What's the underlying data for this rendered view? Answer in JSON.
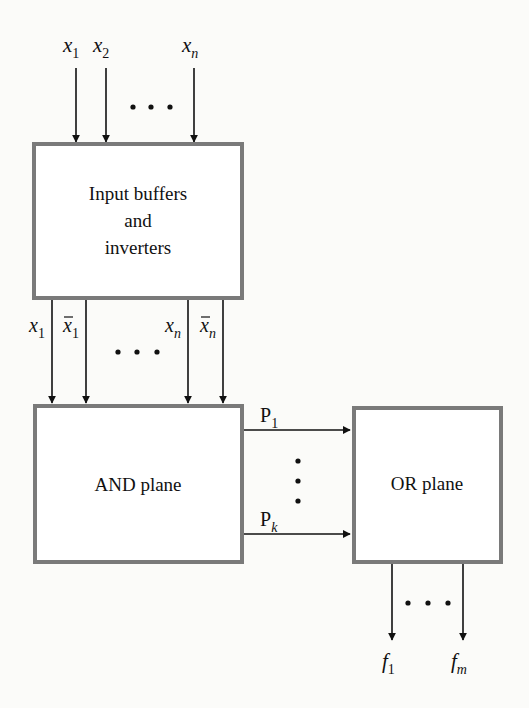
{
  "diagram": {
    "colors": {
      "background": "#fbfbf9",
      "box_border": "#7a7a7a",
      "line": "#111111"
    },
    "inputs": {
      "labels": [
        {
          "base": "x",
          "sub": "1"
        },
        {
          "base": "x",
          "sub": "2"
        },
        {
          "base": "x",
          "sub": "n"
        }
      ],
      "ellipsis": "• • •"
    },
    "input_buffer_box": {
      "lines": [
        "Input buffers",
        "and",
        "inverters"
      ]
    },
    "buffer_outputs": {
      "labels": [
        {
          "base": "x",
          "sub": "1",
          "bar": false
        },
        {
          "base": "x̄",
          "sub": "1",
          "bar": true
        },
        {
          "base": "x",
          "sub": "n",
          "bar": false
        },
        {
          "base": "x̄",
          "sub": "n",
          "bar": true
        }
      ],
      "ellipsis": "• • •"
    },
    "and_plane": {
      "label": "AND plane"
    },
    "product_terms": {
      "labels": [
        {
          "base": "P",
          "sub": "1"
        },
        {
          "base": "P",
          "sub": "k"
        }
      ],
      "ellipsis": "vertical"
    },
    "or_plane": {
      "label": "OR plane"
    },
    "outputs": {
      "labels": [
        {
          "base": "f",
          "sub": "1"
        },
        {
          "base": "f",
          "sub": "m"
        }
      ],
      "ellipsis": "• • •"
    }
  }
}
